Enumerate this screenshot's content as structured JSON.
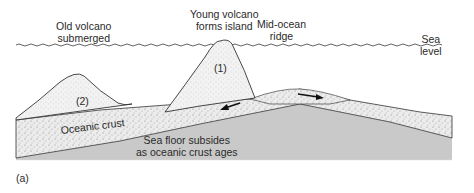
{
  "labels": {
    "old_volcano": [
      "Old volcano",
      "submerged"
    ],
    "young_volcano": [
      "Young volcano",
      "forms island"
    ],
    "ridge": [
      "Mid-ocean",
      "ridge"
    ],
    "sea_level": [
      "Sea",
      "level"
    ],
    "marker_1": "(1)",
    "marker_2": "(2)",
    "crust": "Oceanic crust",
    "subsides": [
      "Sea floor subsides",
      "as oceanic crust ages"
    ],
    "panel": "(a)"
  },
  "colors": {
    "mantle": "#c8c8c8",
    "crust": "#e6e6e6",
    "volcano": "#efefef",
    "line": "#333333",
    "water_line": "#555555"
  }
}
